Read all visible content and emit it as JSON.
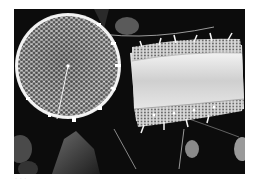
{
  "image": {
    "kind": "scanning electron micrograph",
    "subject": "diatoms",
    "description": "Two diatom frustules on dark background: a circular valve (valve view) with hexagonal areolae and marginal spines on the left, and a cylindrical frustule in girdle view with spines on the right",
    "palette": {
      "background": "#0c0c0c",
      "frustule_light": "#e8e8e8",
      "frustule_mid": "#b5b5b5",
      "areola_dark": "#4a4a4a",
      "debris": "#5a5a5a"
    }
  },
  "caption": {
    "text": "· · ·"
  }
}
